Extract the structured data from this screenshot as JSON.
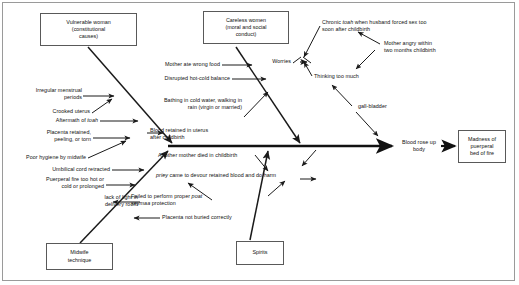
{
  "diagram": {
    "type": "fishbone-ishikawa",
    "title": "",
    "effect": {
      "label": "Madness of\npuerperal\nbed of fire",
      "name": "effect-box"
    },
    "spine_terminal_cause": "Blood rose up\nbody",
    "spine_core_cause": "Blood retained in uterus\nafter childbirth",
    "category_boxes": [
      {
        "id": "vulnerable-woman",
        "label": "Vulnerable woman\n(constitutional\ncauses)",
        "position": "top-left"
      },
      {
        "id": "careless-women",
        "label": "Careless women\n(moral and social\nconduct)",
        "position": "top-middle"
      },
      {
        "id": "midwife-technique",
        "label": "Midwife\ntechnique",
        "position": "bottom-left"
      },
      {
        "id": "spirits",
        "label": "Spirits",
        "position": "bottom-middle"
      }
    ],
    "branches": {
      "vulnerable_woman_causes": [
        "Irregular menstrual\nperiods",
        "Crooked uterus",
        "Aftermath of toah",
        "Placenta retained,\npeeling, or torn"
      ],
      "careless_women_causes": [
        "Mother ate wrong food",
        "Disrupted hot-cold balance",
        "Bathing in cold water, walking in\nrain (virgin or married)"
      ],
      "midwife_technique_causes": [
        "Poor hygiene by midwife",
        "Umbilical cord retracted",
        "Puerperal fire too hot or\ncold or prolonged",
        "lack of light in\ndelivery room"
      ],
      "spirits_causes": [
        "Another mother died in childbirth",
        "priey came to devour retained blood and do harm",
        "Failed to perform proper poat\nseymaa protection",
        "Placenta not buried correctly"
      ],
      "worries_branch": [
        "Worries",
        "Chronic toah when husband forced sex too\nsoon after childbirth",
        "Mother angry within\ntwo months childbirth",
        "Thinking too much"
      ],
      "gall_bladder_branch": [
        "gall-bladder"
      ]
    },
    "italic_terms": [
      "toah",
      "priey",
      "poat seymaa"
    ],
    "labels": {
      "vulnerable_woman_box": "Vulnerable woman\n(constitutional\ncauses)",
      "careless_women_box": "Careless women\n(moral and social\nconduct)",
      "midwife_technique_box": "Midwife\ntechnique",
      "spirits_box": "Spirits",
      "madness_box": "Madness of\npuerperal\nbed of fire",
      "irregular_menstrual": "Irregular menstrual\nperiods",
      "crooked_uterus": "Crooked uterus",
      "aftermath_toah_pre": "Aftermath of ",
      "aftermath_toah_it": "toah",
      "placenta_retained": "Placenta retained,\npeeling, or torn",
      "poor_hygiene": "Poor hygiene by midwife",
      "umbilical_cord": "Umbilical cord retracted",
      "puerperal_fire": "Puerperal fire too hot or\ncold or prolonged",
      "lack_of_light": "lack of light in\ndelivery room",
      "mother_ate_wrong_food": "Mother ate wrong food",
      "disrupted_hot_cold": "Disrupted hot-cold balance",
      "bathing_cold_water": "Bathing in cold water, walking in\nrain (virgin or married)",
      "blood_retained": "Blood retained in uterus\nafter childbirth",
      "another_mother_died": "Another mother died in childbirth",
      "priey_it": "priey",
      "priey_rest": " came to devour retained blood and do harm",
      "failed_poat_pre": "Failed to perform proper ",
      "failed_poat_it": "poat\nseymaa",
      "failed_poat_post": " protection",
      "placenta_not_buried": "Placenta not buried correctly",
      "worries": "Worries",
      "chronic_toah_pre": "Chronic ",
      "chronic_toah_it": "toah",
      "chronic_toah_post": " when husband forced sex too\nsoon after childbirth",
      "mother_angry": "Mother angry within\ntwo months childbirth",
      "thinking_too_much": "Thinking too much",
      "gall_bladder": "gall-bladder",
      "blood_rose_up": "Blood rose up\nbody"
    }
  },
  "colors": {
    "line": "#1a1a1a",
    "box_border": "#595959",
    "frame": "#9a9a9a",
    "text": "#111111",
    "background": "#ffffff"
  }
}
